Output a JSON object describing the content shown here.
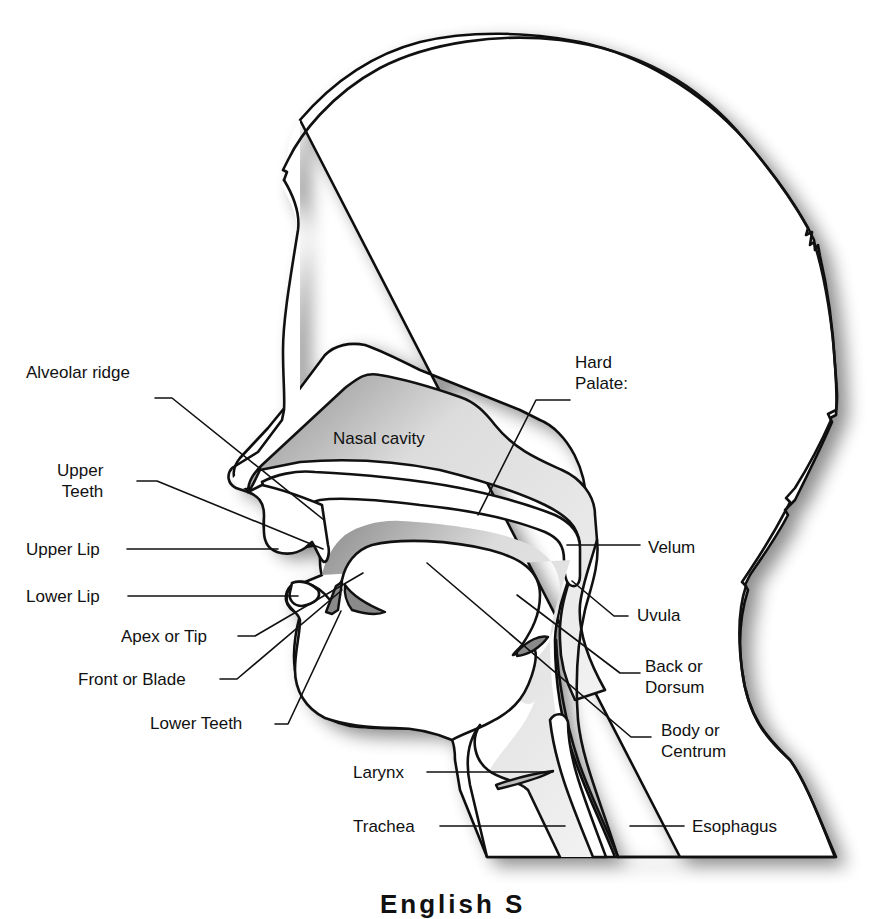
{
  "diagram": {
    "labels": {
      "alveolar_ridge": "Alveolar ridge",
      "nasal_cavity": "Nasal cavity",
      "hard_palate": "Hard\nPalate:",
      "upper_teeth": "Upper\nTeeth",
      "upper_lip": "Upper Lip",
      "velum": "Velum",
      "lower_lip": "Lower Lip",
      "uvula": "Uvula",
      "apex_or_tip": "Apex or Tip",
      "back_or_dorsum": "Back or\nDorsum",
      "front_or_blade": "Front or Blade",
      "lower_teeth": "Lower Teeth",
      "body_or_centrum": "Body or\nCentrum",
      "larynx": "Larynx",
      "trachea": "Trachea",
      "esophagus": "Esophagus"
    },
    "caption_partial": "English S"
  },
  "colors": {
    "outline": "#111111",
    "background": "#ffffff",
    "cavity_shade_dark": "#8c8c8c",
    "cavity_shade_light": "#f4f4f4",
    "shadow": "#b5b5b5"
  }
}
